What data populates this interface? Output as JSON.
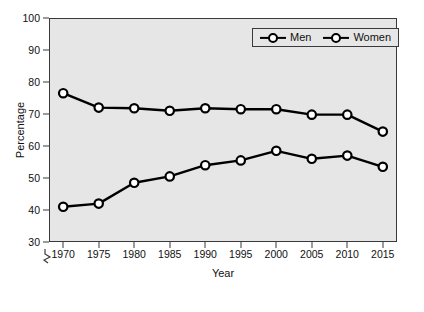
{
  "chart_data": {
    "type": "line",
    "title": "",
    "xlabel": "Year",
    "ylabel": "Percentage",
    "x": [
      1970,
      1975,
      1980,
      1985,
      1990,
      1995,
      2000,
      2005,
      2010,
      2015
    ],
    "xticklabels": [
      "1970",
      "1975",
      "1980",
      "1985",
      "1990",
      "1995",
      "2000",
      "2005",
      "2010",
      "2015"
    ],
    "yticklabels": [
      "30",
      "40",
      "50",
      "60",
      "70",
      "80",
      "90",
      "100"
    ],
    "yticks": [
      30,
      40,
      50,
      60,
      70,
      80,
      90,
      100
    ],
    "ylim": [
      30,
      100
    ],
    "xlim": [
      1968,
      2017
    ],
    "grid": false,
    "legend_position": "top-right",
    "axis_break": true,
    "series": [
      {
        "name": "Men",
        "marker": "open-circle",
        "color": "#000000",
        "values": [
          76.5,
          72.0,
          71.8,
          71.0,
          71.8,
          71.5,
          71.5,
          69.8,
          69.8,
          64.5
        ]
      },
      {
        "name": "Women",
        "marker": "open-circle",
        "color": "#000000",
        "values": [
          41.0,
          42.0,
          48.5,
          50.5,
          54.0,
          55.5,
          58.5,
          56.0,
          57.0,
          53.5
        ]
      }
    ]
  },
  "legend": {
    "items": [
      {
        "label": "Men"
      },
      {
        "label": "Women"
      }
    ]
  },
  "colors": {
    "plot_background": "#e6e6e6",
    "page_background": "#ffffff",
    "axis": "#3a3a3a",
    "line": "#000000",
    "marker_fill": "#ffffff"
  }
}
